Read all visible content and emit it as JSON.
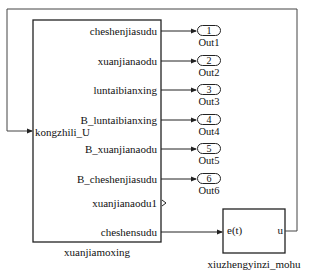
{
  "blocks": {
    "main": {
      "name": "xuanjiamoxing",
      "input_port": "kongzhili_U",
      "output_ports": [
        "cheshenjiasudu",
        "xuanjianaodu",
        "luntaibianxing",
        "B_luntaibianxing",
        "B_xuanjianaodu",
        "B_cheshenjiasudu",
        "xuanjianaodu1",
        "cheshensudu"
      ]
    },
    "controller": {
      "name": "xiuzhengyinzi_mohu",
      "input_port": "e(t)",
      "output_port": "u"
    }
  },
  "outports": [
    {
      "number": "1",
      "name": "Out1"
    },
    {
      "number": "2",
      "name": "Out2"
    },
    {
      "number": "3",
      "name": "Out3"
    },
    {
      "number": "4",
      "name": "Out4"
    },
    {
      "number": "5",
      "name": "Out5"
    },
    {
      "number": "6",
      "name": "Out6"
    }
  ]
}
